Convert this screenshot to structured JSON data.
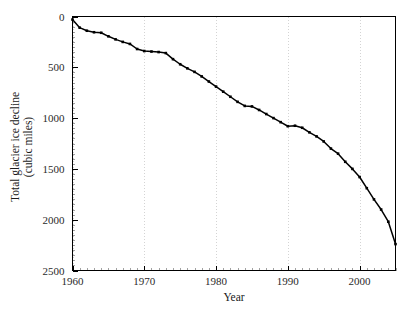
{
  "chart_data": {
    "type": "line",
    "title": "",
    "xlabel": "Year",
    "ylabel": "Total glacier ice decline (cubic miles)",
    "ylabel_line1": "Total glacier ice decline",
    "ylabel_line2": "(cubic miles)",
    "xlim": [
      1960,
      2005
    ],
    "ylim": [
      0,
      2500
    ],
    "y_axis_inverted": true,
    "grid": "vertical-dotted-at-decades",
    "legend": "none",
    "x_ticks": [
      1960,
      1970,
      1980,
      1990,
      2000
    ],
    "x_tick_labels": [
      "1960",
      "1970",
      "1980",
      "1990",
      "2000"
    ],
    "y_ticks": [
      0,
      500,
      1000,
      1500,
      2000,
      2500
    ],
    "y_tick_labels": [
      "0",
      "500",
      "1000",
      "1500",
      "2000",
      "2500"
    ],
    "x_minor_tick_interval": 1,
    "y_minor_tick_interval": 50,
    "series": [
      {
        "name": "Cumulative glacier ice decline",
        "marker": "square",
        "color": "#000000",
        "x": [
          1960,
          1961,
          1962,
          1963,
          1964,
          1965,
          1966,
          1967,
          1968,
          1969,
          1970,
          1971,
          1972,
          1973,
          1974,
          1975,
          1976,
          1977,
          1978,
          1979,
          1980,
          1981,
          1982,
          1983,
          1984,
          1985,
          1986,
          1987,
          1988,
          1989,
          1990,
          1991,
          1992,
          1993,
          1994,
          1995,
          1996,
          1997,
          1998,
          1999,
          2000,
          2001,
          2002,
          2003,
          2004,
          2005
        ],
        "values": [
          30,
          110,
          140,
          155,
          160,
          195,
          225,
          250,
          270,
          320,
          340,
          345,
          350,
          360,
          420,
          470,
          510,
          545,
          590,
          640,
          690,
          740,
          790,
          840,
          880,
          885,
          920,
          960,
          1000,
          1040,
          1080,
          1075,
          1095,
          1140,
          1180,
          1230,
          1300,
          1350,
          1430,
          1500,
          1580,
          1690,
          1800,
          1900,
          2020,
          2240
        ]
      }
    ]
  },
  "figure": {
    "background_color": "#ffffff",
    "axis_color": "#000000",
    "grid_color": "#c9c9c9"
  }
}
